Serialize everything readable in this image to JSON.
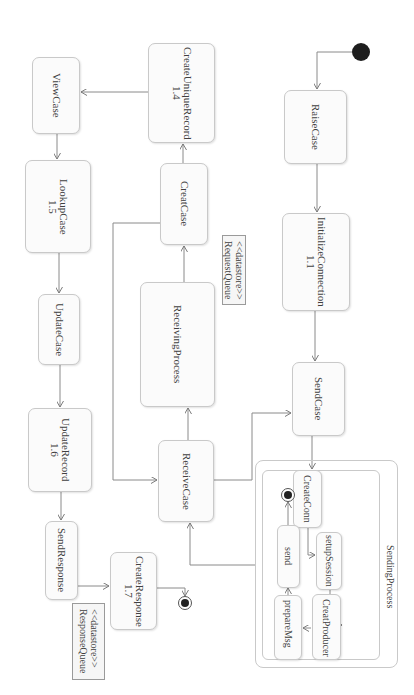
{
  "diagram": {
    "type": "UML activity diagram (rotated 90° clockwise)",
    "colors": {
      "stroke": "#8a8a8a",
      "node_fill": "#fbfbfb",
      "node_border": "#c9c9c9",
      "start": "#1e1e1e"
    },
    "nodes": {
      "raise_case": {
        "label": "RaiseCase"
      },
      "initialize_connection": {
        "label": "InitializeConnection",
        "number": "1.1"
      },
      "send_case": {
        "label": "SendCase"
      },
      "sending_process": {
        "title": "SendingProcess",
        "create_conn": {
          "label": "CreateConn"
        },
        "setup_session": {
          "label": "setupSession"
        },
        "creat_producer": {
          "label": "CreatProducer"
        },
        "prepare_msg": {
          "label": "prepareMsg"
        },
        "send": {
          "label": "send"
        }
      },
      "receive_case": {
        "label": "ReceiveCase"
      },
      "receiving_process": {
        "label": "ReceivingProcess"
      },
      "creat_case": {
        "label": "CreatCase"
      },
      "create_unique_record": {
        "label": "CreateUniqueRecord",
        "number": "1.4"
      },
      "view_case": {
        "label": "ViewCase"
      },
      "lookup_case": {
        "label": "LookupCase",
        "number": "1.5"
      },
      "update_case": {
        "label": "UpdateCase"
      },
      "update_record": {
        "label": "UpdateRecord",
        "number": "1.6"
      },
      "send_response": {
        "label": "SendResponse"
      },
      "create_response": {
        "label": "CreateResponse",
        "number": "1.7"
      }
    },
    "datastores": {
      "request_queue": {
        "stereotype": "<<datastore>>",
        "label": "RequestQueue"
      },
      "response_queue": {
        "stereotype": "<<datastore>>",
        "label": "ResponseQueue"
      }
    },
    "edges": [
      [
        "start",
        "RaiseCase"
      ],
      [
        "RaiseCase",
        "InitializeConnection"
      ],
      [
        "InitializeConnection",
        "SendCase"
      ],
      [
        "SendCase",
        "CreateConn"
      ],
      [
        "CreateConn",
        "setupSession"
      ],
      [
        "setupSession",
        "CreatProducer"
      ],
      [
        "CreatProducer",
        "prepareMsg"
      ],
      [
        "prepareMsg",
        "send"
      ],
      [
        "send",
        "inner-final"
      ],
      [
        "SendingProcess",
        "ReceiveCase"
      ],
      [
        "ReceiveCase",
        "ReceivingProcess"
      ],
      [
        "ReceiveCase",
        "SendCase"
      ],
      [
        "ReceivingProcess",
        "CreatCase"
      ],
      [
        "CreatCase",
        "ReceiveCase"
      ],
      [
        "CreatCase",
        "CreateUniqueRecord"
      ],
      [
        "CreateUniqueRecord",
        "ViewCase"
      ],
      [
        "ViewCase",
        "LookupCase"
      ],
      [
        "LookupCase",
        "UpdateCase"
      ],
      [
        "UpdateCase",
        "UpdateRecord"
      ],
      [
        "UpdateRecord",
        "SendResponse"
      ],
      [
        "SendResponse",
        "CreateResponse"
      ],
      [
        "CreateResponse",
        "final"
      ]
    ]
  }
}
